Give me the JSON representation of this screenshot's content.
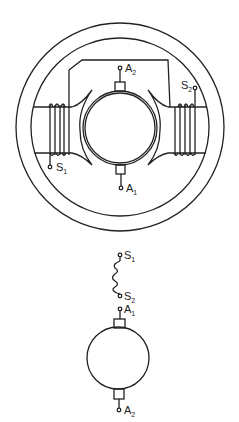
{
  "diagram": {
    "motor_cross_section": {
      "terminals": {
        "armature_top": "A",
        "armature_top_sub": "2",
        "armature_bottom": "A",
        "armature_bottom_sub": "1",
        "field_left": "S",
        "field_left_sub": "1",
        "field_right": "S",
        "field_right_sub": "2"
      }
    },
    "schematic": {
      "terminals": {
        "field_top": "S",
        "field_top_sub": "1",
        "field_bottom": "S",
        "field_bottom_sub": "2",
        "armature_top": "A",
        "armature_top_sub": "1",
        "armature_bottom": "A",
        "armature_bottom_sub": "2"
      }
    },
    "colors": {
      "line": "#222222",
      "background": "#ffffff"
    }
  }
}
